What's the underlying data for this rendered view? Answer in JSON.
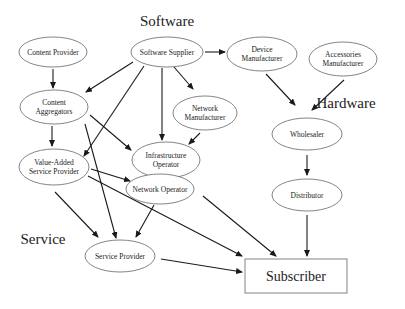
{
  "sections": {
    "software": {
      "label": "Software",
      "x": 167,
      "y": 26
    },
    "hardware": {
      "label": "Hardware",
      "x": 346,
      "y": 108
    },
    "service": {
      "label": "Service",
      "x": 43,
      "y": 244
    }
  },
  "nodes": {
    "content_provider": {
      "lines": [
        "Content Provider"
      ],
      "cx": 53,
      "cy": 52,
      "rx": 34,
      "ry": 15
    },
    "software_supplier": {
      "lines": [
        "Software Supplier"
      ],
      "cx": 167,
      "cy": 52,
      "rx": 36,
      "ry": 15
    },
    "device_manufacturer": {
      "lines": [
        "Device",
        "Manufacturer"
      ],
      "cx": 262,
      "cy": 54,
      "rx": 35,
      "ry": 17
    },
    "accessories_manufacturer": {
      "lines": [
        "Accessories",
        "Manufacturer"
      ],
      "cx": 343,
      "cy": 59,
      "rx": 34,
      "ry": 17
    },
    "content_aggregators": {
      "lines": [
        "Content",
        "Aggregators"
      ],
      "cx": 54,
      "cy": 107,
      "rx": 34,
      "ry": 17
    },
    "network_manufacturer": {
      "lines": [
        "Network",
        "Manufacturer"
      ],
      "cx": 205,
      "cy": 113,
      "rx": 32,
      "ry": 17
    },
    "wholesaler": {
      "lines": [
        "Wholesaler"
      ],
      "cx": 307,
      "cy": 134,
      "rx": 35,
      "ry": 16
    },
    "infrastructure_operator": {
      "lines": [
        "Infrastructure",
        "Operator"
      ],
      "cx": 166,
      "cy": 160,
      "rx": 34,
      "ry": 18
    },
    "value_added_service_provider": {
      "lines": [
        "Value-Added",
        "Service Provider"
      ],
      "cx": 54,
      "cy": 167,
      "rx": 35,
      "ry": 18
    },
    "network_operator": {
      "lines": [
        "Network Operator"
      ],
      "cx": 160,
      "cy": 189,
      "rx": 34,
      "ry": 15
    },
    "distributor": {
      "lines": [
        "Distributor"
      ],
      "cx": 307,
      "cy": 195,
      "rx": 35,
      "ry": 16
    },
    "service_provider": {
      "lines": [
        "Service Provider"
      ],
      "cx": 120,
      "cy": 256,
      "rx": 35,
      "ry": 16
    }
  },
  "subscriber": {
    "label": "Subscriber",
    "x": 245,
    "y": 259,
    "width": 102,
    "height": 34
  },
  "edges": [
    {
      "from": "software_supplier",
      "to": "device_manufacturer",
      "x1": 205,
      "y1": 52,
      "x2": 225,
      "y2": 52
    },
    {
      "from": "content_provider",
      "to": "content_aggregators",
      "x1": 53,
      "y1": 69,
      "x2": 53,
      "y2": 88
    },
    {
      "from": "software_supplier",
      "to": "content_aggregators",
      "x1": 133,
      "y1": 62,
      "x2": 86,
      "y2": 92
    },
    {
      "from": "software_supplier",
      "to": "value_added_service_provider",
      "x1": 144,
      "y1": 66,
      "x2": 84,
      "y2": 156
    },
    {
      "from": "software_supplier",
      "to": "infrastructure_operator",
      "x1": 162,
      "y1": 68,
      "x2": 162,
      "y2": 140
    },
    {
      "from": "software_supplier",
      "to": "network_manufacturer",
      "x1": 174,
      "y1": 67,
      "x2": 193,
      "y2": 89
    },
    {
      "from": "device_manufacturer",
      "to": "wholesaler",
      "x1": 266,
      "y1": 74,
      "x2": 295,
      "y2": 105
    },
    {
      "from": "accessories_manufacturer",
      "to": "wholesaler",
      "x1": 344,
      "y1": 80,
      "x2": 312,
      "y2": 110
    },
    {
      "from": "content_aggregators",
      "to": "value_added_service_provider",
      "x1": 52,
      "y1": 126,
      "x2": 52,
      "y2": 146
    },
    {
      "from": "content_aggregators",
      "to": "infrastructure_operator",
      "x1": 90,
      "y1": 115,
      "x2": 131,
      "y2": 150
    },
    {
      "from": "content_aggregators",
      "to": "service_provider",
      "x1": 85,
      "y1": 124,
      "x2": 116,
      "y2": 238
    },
    {
      "from": "network_manufacturer",
      "to": "infrastructure_operator",
      "x1": 200,
      "y1": 133,
      "x2": 189,
      "y2": 144
    },
    {
      "from": "wholesaler",
      "to": "distributor",
      "x1": 307,
      "y1": 155,
      "x2": 307,
      "y2": 175
    },
    {
      "from": "value_added_service_provider",
      "to": "network_operator",
      "x1": 91,
      "y1": 169,
      "x2": 130,
      "y2": 181
    },
    {
      "from": "value_added_service_provider",
      "to": "subscriber",
      "x1": 88,
      "y1": 176,
      "x2": 242,
      "y2": 256
    },
    {
      "from": "value_added_service_provider",
      "to": "service_provider",
      "x1": 55,
      "y1": 192,
      "x2": 98,
      "y2": 237
    },
    {
      "from": "network_operator",
      "to": "service_provider",
      "x1": 154,
      "y1": 205,
      "x2": 136,
      "y2": 237
    },
    {
      "from": "network_operator",
      "to": "subscriber",
      "x1": 203,
      "y1": 196,
      "x2": 276,
      "y2": 256
    },
    {
      "from": "distributor",
      "to": "subscriber",
      "x1": 307,
      "y1": 215,
      "x2": 307,
      "y2": 256
    },
    {
      "from": "service_provider",
      "to": "subscriber",
      "x1": 161,
      "y1": 259,
      "x2": 242,
      "y2": 272
    }
  ]
}
